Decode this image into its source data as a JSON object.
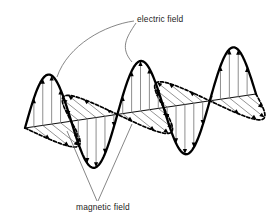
{
  "figure": {
    "background_color": "#ffffff",
    "width": 269,
    "height": 222
  },
  "labels": {
    "electric_field": "electric field",
    "magnetic_field": "magnetic field"
  },
  "colors": {
    "wave_stroke": "#000000",
    "axis_stroke": "#111111",
    "arrow_shaft": "#8e8e8e",
    "arrow_head": "#000000",
    "leader_line": "#5d5d5d",
    "text": "#1a1a1a"
  },
  "chart_data": {
    "type": "line",
    "xlabel": "",
    "ylabel": "",
    "grid": false,
    "legend": "inline-annotations",
    "axis": {
      "name": "propagation-axis",
      "x1": 25,
      "y1": 128,
      "x2": 256,
      "y2": 94,
      "description": "direction of propagation, drawn in perspective from lower-left to upper-right"
    },
    "series": [
      {
        "name": "electric field",
        "style": "solid",
        "orientation": "vertical",
        "cycles": 2.5,
        "amplitude_px": 50,
        "arrow_count": 25,
        "description": "solid sinusoid oscillating perpendicular to propagation axis, in the vertical plane"
      },
      {
        "name": "magnetic field",
        "style": "dashed",
        "orientation": "oblique",
        "cycles": 2.5,
        "amplitude_px": 36,
        "phase_offset_deg": 0,
        "arrow_count": 25,
        "description": "dashed sinusoid oscillating perpendicular to both the propagation axis and the electric field, drawn receding in perspective"
      }
    ],
    "annotations": [
      {
        "text": "electric field",
        "x": 137,
        "y": 22,
        "leaders": [
          {
            "to_x": 56,
            "to_y": 78
          },
          {
            "to_x": 133,
            "to_y": 62
          }
        ]
      },
      {
        "text": "magnetic field",
        "x": 76,
        "y": 210,
        "leaders": [
          {
            "to_x": 66,
            "to_y": 131
          },
          {
            "to_x": 132,
            "to_y": 123
          }
        ]
      }
    ]
  }
}
